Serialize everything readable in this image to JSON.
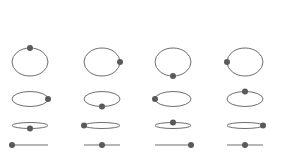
{
  "diagram": {
    "colors": {
      "stroke": "#6e6e6e",
      "dot": "#5a5a5a",
      "background": "#ffffff"
    },
    "columns_cx": [
      30,
      102,
      173,
      245
    ],
    "rx": 18,
    "rows": [
      {
        "cy": 62,
        "ry": 14,
        "dot_angles_deg": [
          90,
          0,
          270,
          180
        ]
      },
      {
        "cy": 99,
        "ry": 7.5,
        "dot_angles_deg": [
          0,
          270,
          180,
          90
        ]
      },
      {
        "cy": 125.5,
        "ry": 3,
        "dot_angles_deg": [
          270,
          180,
          90,
          0
        ]
      },
      {
        "cy": 145,
        "ry": 0,
        "dot_angles_deg": [
          180,
          90,
          0,
          90
        ]
      }
    ],
    "dot_radius": 3
  }
}
